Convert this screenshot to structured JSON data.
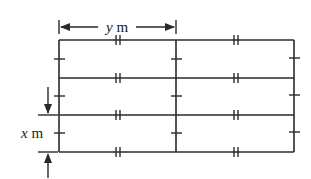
{
  "diagram": {
    "type": "grid-fence",
    "columns": 2,
    "rows": 3,
    "stroke_color": "#2a2a2a",
    "labels": {
      "width_var": "y",
      "width_unit": " m",
      "height_var": "x",
      "height_unit": " m"
    },
    "marks": {
      "horizontal_segments": "double-tick",
      "vertical_segments": "single-tick"
    }
  }
}
